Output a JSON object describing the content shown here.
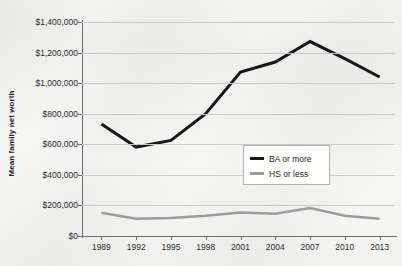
{
  "chart_data": {
    "type": "line",
    "title": "",
    "subtitle": "",
    "xlabel": "",
    "ylabel": "Mean family net worth",
    "x": [
      1989,
      1992,
      1995,
      1998,
      2001,
      2004,
      2007,
      2010,
      2013
    ],
    "xtick_labels": [
      "1989",
      "1992",
      "1995",
      "1998",
      "2001",
      "2004",
      "2007",
      "2010",
      "2013"
    ],
    "ytick_labels": [
      "$0",
      "$200,000",
      "$400,000",
      "$600,000",
      "$800,000",
      "$1,000,000",
      "$1,200,000",
      "$1,400,000"
    ],
    "ytick_values": [
      0,
      200000,
      400000,
      600000,
      800000,
      1000000,
      1200000,
      1400000
    ],
    "ylim": [
      0,
      1400000
    ],
    "grid": "horizontal",
    "legend_position": "center-right",
    "series": [
      {
        "name": "BA or more",
        "color": "#171717",
        "linewidth": 3,
        "values": [
          733000,
          582000,
          625000,
          800000,
          1073000,
          1138000,
          1272000,
          1160000,
          1040000
        ]
      },
      {
        "name": "HS or less",
        "color": "#9b9b9b",
        "linewidth": 2.5,
        "values": [
          152000,
          113000,
          118000,
          132000,
          153000,
          146000,
          183000,
          133000,
          113000
        ]
      }
    ]
  },
  "legend": {
    "items": [
      {
        "label": "BA or more",
        "swatch": "line-swatch-black"
      },
      {
        "label": "HS or less",
        "swatch": "line-swatch-gray"
      }
    ]
  },
  "colors": {
    "background": "#f4f4f2",
    "gridline": "#c9c9c9",
    "axis": "#6e6e6e",
    "ba_line": "#171717",
    "hs_line": "#9b9b9b",
    "text": "#2b2b2b"
  }
}
